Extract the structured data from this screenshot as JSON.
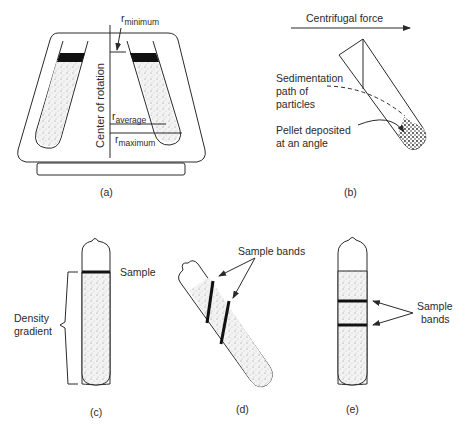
{
  "figure": {
    "panels": [
      {
        "id": "a",
        "caption": "(a)",
        "labels": {
          "r_min_base": "r",
          "r_min_sub": "minimum",
          "r_avg_base": "r",
          "r_avg_sub": "average",
          "r_max_base": "r",
          "r_max_sub": "maximum",
          "axis": "Center of rotation"
        }
      },
      {
        "id": "b",
        "caption": "(b)",
        "labels": {
          "force": "Centrifugal force",
          "path_line1": "Sedimentation",
          "path_line2": "path of",
          "path_line3": "particles",
          "pellet_line1": "Pellet deposited",
          "pellet_line2": "at an angle"
        }
      },
      {
        "id": "c",
        "caption": "(c)",
        "labels": {
          "sample": "Sample",
          "gradient_line1": "Density",
          "gradient_line2": "gradient"
        }
      },
      {
        "id": "d",
        "caption": "(d)",
        "labels": {
          "bands": "Sample bands"
        }
      },
      {
        "id": "e",
        "caption": "(e)",
        "labels": {
          "bands_line1": "Sample",
          "bands_line2": "bands"
        }
      }
    ]
  }
}
